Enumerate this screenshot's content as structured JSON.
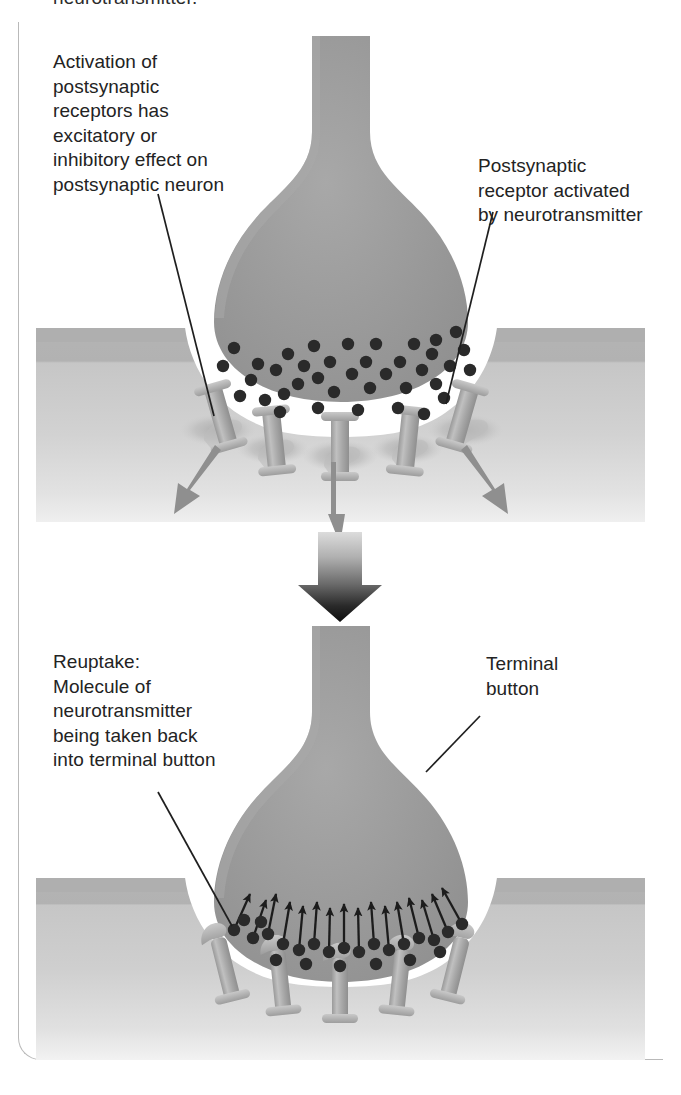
{
  "figure": {
    "clipped_text_above": "neurotransmitter.",
    "panels": [
      {
        "id": "top-panel",
        "name": "receptor-activation-panel",
        "description": "Terminal button releasing neurotransmitter molecules into the synaptic cleft, molecules binding postsynaptic receptors"
      },
      {
        "id": "bottom-panel",
        "name": "reuptake-panel",
        "description": "Neurotransmitter molecules being taken back up into the terminal button"
      }
    ]
  },
  "labels": {
    "activation": {
      "name": "label-activation",
      "lines": [
        "Activation of",
        "postsynaptic",
        "receptors has",
        "excitatory or",
        "inhibitory effect on",
        "postsynaptic neuron"
      ],
      "text": "Activation of\npostsynaptic\nreceptors has\nexcitatory or\ninhibitory effect on\npostsynaptic neuron"
    },
    "postsynaptic_receptor": {
      "name": "label-postsynaptic-receptor",
      "lines": [
        "Postsynaptic",
        "receptor activated",
        "by neurotransmitter"
      ],
      "text": "Postsynaptic\nreceptor activated\nby neurotransmitter"
    },
    "reuptake": {
      "name": "label-reuptake",
      "lines": [
        "Reuptake:",
        "Molecule of",
        "neurotransmitter",
        "being taken back",
        "into terminal button"
      ],
      "text": "Reuptake:\nMolecule of\nneurotransmitter\nbeing taken back\ninto terminal button"
    },
    "terminal_button": {
      "name": "label-terminal-button",
      "lines": [
        "Terminal",
        "button"
      ],
      "text": "Terminal\nbutton"
    }
  },
  "colors": {
    "text": "#232323",
    "frame_border": "#b9b9b9",
    "terminal_button_fill": "#9a9a9a",
    "terminal_button_edge": "#8d8d8d",
    "membrane_top_band": "#b3b3b3",
    "membrane_body": "#c3c3c3",
    "membrane_lower": "#d4d4d4",
    "cleft": "#ffffff",
    "molecule": "#2a2a2a",
    "receptor_fill": "#b0b0b0",
    "receptor_edge": "#8e8e8e",
    "effect_arrow": "#8f8f8f",
    "reuptake_arrow": "#1c1c1c",
    "transition_arrow_top": "#d8d8d8",
    "transition_arrow_bottom": "#111111",
    "leader_line": "#1f1f1f",
    "page_background": "#ffffff"
  },
  "counts": {
    "receptors_top_panel": 5,
    "receptors_bottom_panel": 5,
    "effect_arrows_top_panel": 3,
    "molecules_top_panel": 36,
    "reuptake_arrows_bottom_panel": 24
  }
}
